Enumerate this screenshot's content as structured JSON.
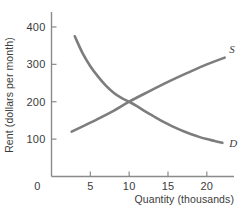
{
  "chart_data": {
    "type": "line",
    "title": "",
    "xlabel": "Quantity (thousands)",
    "ylabel": "Rent (dollars per month)",
    "xlim": [
      0,
      23.5
    ],
    "ylim": [
      0,
      440
    ],
    "xticks": [
      0,
      5,
      10,
      15,
      20
    ],
    "xtick_labels": [
      "0",
      "5",
      "10",
      "15",
      "20"
    ],
    "yticks": [
      100,
      200,
      300,
      400
    ],
    "ytick_labels": [
      "100",
      "200",
      "300",
      "400"
    ],
    "grid": false,
    "legend": "inline-curve-labels",
    "equilibrium": {
      "quantity": 10,
      "rent": 200
    },
    "series": [
      {
        "name": "D",
        "label": "D",
        "label_position": {
          "x": 22.9,
          "y": 78
        },
        "points": [
          {
            "x": 3.0,
            "y": 375
          },
          {
            "x": 4.0,
            "y": 330
          },
          {
            "x": 5.0,
            "y": 295
          },
          {
            "x": 6.0,
            "y": 267
          },
          {
            "x": 7.0,
            "y": 243
          },
          {
            "x": 8.0,
            "y": 224
          },
          {
            "x": 9.0,
            "y": 210
          },
          {
            "x": 10.0,
            "y": 200
          },
          {
            "x": 11.0,
            "y": 188
          },
          {
            "x": 12.0,
            "y": 175
          },
          {
            "x": 13.0,
            "y": 163
          },
          {
            "x": 14.0,
            "y": 151
          },
          {
            "x": 15.0,
            "y": 140
          },
          {
            "x": 16.0,
            "y": 130
          },
          {
            "x": 17.0,
            "y": 121
          },
          {
            "x": 18.0,
            "y": 113
          },
          {
            "x": 19.0,
            "y": 106
          },
          {
            "x": 20.0,
            "y": 100
          },
          {
            "x": 21.0,
            "y": 95
          },
          {
            "x": 22.0,
            "y": 90
          }
        ]
      },
      {
        "name": "S",
        "label": "S",
        "label_position": {
          "x": 22.9,
          "y": 330
        },
        "points": [
          {
            "x": 2.6,
            "y": 120
          },
          {
            "x": 5.0,
            "y": 144
          },
          {
            "x": 7.5,
            "y": 170
          },
          {
            "x": 10.0,
            "y": 200
          },
          {
            "x": 12.5,
            "y": 227
          },
          {
            "x": 15.0,
            "y": 253
          },
          {
            "x": 17.5,
            "y": 277
          },
          {
            "x": 20.0,
            "y": 300
          },
          {
            "x": 22.3,
            "y": 318
          }
        ]
      }
    ]
  }
}
